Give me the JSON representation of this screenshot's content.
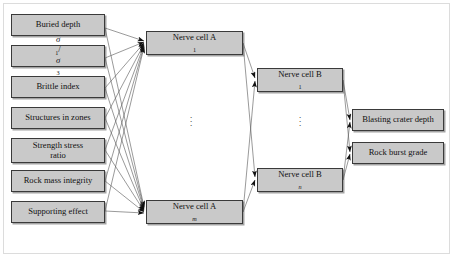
{
  "figure": {
    "type": "neural-network-architecture",
    "title": "",
    "layers": [
      {
        "id": "input",
        "name": "Input layer",
        "nodes": [
          {
            "label": "Buried depth"
          },
          {
            "label": "σ₁/σ₃",
            "base": "σ",
            "sub1": "1",
            "sub2": "3"
          },
          {
            "label": "Brittle index"
          },
          {
            "label": "Structures in zones"
          },
          {
            "label": "Strength stress ratio",
            "line1": "Strength stress",
            "line2": "ratio"
          },
          {
            "label": "Rock mass integrity"
          },
          {
            "label": "Supporting effect"
          }
        ]
      },
      {
        "id": "hidden_a",
        "name": "Hidden layer A",
        "ellipsis": "⋮",
        "nodes": [
          {
            "label": "Nerve cell A",
            "prefix": "Nerve cell A",
            "sub": "1"
          },
          {
            "label": "Nerve cell A",
            "prefix": "Nerve cell A",
            "sub": "m"
          }
        ]
      },
      {
        "id": "hidden_b",
        "name": "Hidden layer B",
        "ellipsis": "⋮",
        "nodes": [
          {
            "label": "Nerve cell B",
            "prefix": "Nerve cell B",
            "sub": "1"
          },
          {
            "label": "Nerve cell B",
            "prefix": "Nerve cell B",
            "sub": "n"
          }
        ]
      },
      {
        "id": "output",
        "name": "Output layer",
        "nodes": [
          {
            "label": "Blasting crater depth"
          },
          {
            "label": "Rock burst grade"
          }
        ]
      }
    ],
    "colors": {
      "node_fill": "#c9c9c9",
      "node_border": "#3a3a3a",
      "wire": "#555555",
      "frame": "#dcdcdc",
      "background": "#ffffff"
    }
  }
}
